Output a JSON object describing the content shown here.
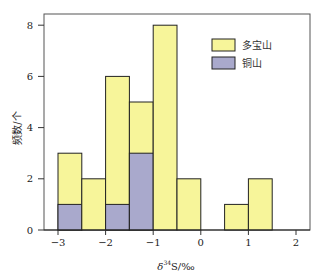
{
  "chart_data": {
    "type": "bar",
    "stacked": true,
    "title": "",
    "xlabel": "δ34S/‰",
    "ylabel": "频数/个",
    "xlim": [
      -3.3,
      2.3
    ],
    "ylim": [
      0,
      8.5
    ],
    "xticks": [
      -3,
      -2,
      -1,
      0,
      1,
      2
    ],
    "xtick_labels": [
      "−3",
      "−2",
      "−1",
      "0",
      "1",
      "2"
    ],
    "yticks": [
      0,
      2,
      4,
      6,
      8
    ],
    "ytick_labels": [
      "0",
      "2",
      "4",
      "6",
      "8"
    ],
    "bin_width": 0.5,
    "bins": [
      {
        "x0": -3.0,
        "x1": -2.5,
        "total": 3,
        "tongshan": 1
      },
      {
        "x0": -2.5,
        "x1": -2.0,
        "total": 2,
        "tongshan": 0
      },
      {
        "x0": -2.0,
        "x1": -1.5,
        "total": 6,
        "tongshan": 1
      },
      {
        "x0": -1.5,
        "x1": -1.0,
        "total": 5,
        "tongshan": 3
      },
      {
        "x0": -1.0,
        "x1": -0.5,
        "total": 8,
        "tongshan": 0
      },
      {
        "x0": -0.5,
        "x1": 0.0,
        "total": 2,
        "tongshan": 0
      },
      {
        "x0": 0.5,
        "x1": 1.0,
        "total": 1,
        "tongshan": 0
      },
      {
        "x0": 1.0,
        "x1": 1.5,
        "total": 2,
        "tongshan": 0
      }
    ],
    "categories": [
      "-3~-2.5",
      "-2.5~-2",
      "-2~-1.5",
      "-1.5~-1",
      "-1~-0.5",
      "-0.5~0",
      "0.5~1",
      "1~1.5"
    ],
    "series": [
      {
        "name": "多宝山",
        "color": "#f7f59a",
        "values": [
          2,
          2,
          5,
          2,
          8,
          2,
          1,
          2
        ]
      },
      {
        "name": "铜山",
        "color": "#a9a9cc",
        "values": [
          1,
          0,
          1,
          3,
          0,
          0,
          0,
          0
        ]
      }
    ],
    "legend": {
      "position": "upper right",
      "entries": [
        "多宝山",
        "铜山"
      ]
    },
    "grid": false
  },
  "colors": {
    "duobaoshan": "#f7f59a",
    "tongshan": "#a9a9cc",
    "edge": "#222222",
    "frame": "#555555"
  },
  "labels": {
    "xlabel_prefix": "δ",
    "xlabel_sup": "34",
    "xlabel_suffix": "S/‰",
    "ylabel": "频数/个",
    "legend_duobaoshan": "多宝山",
    "legend_tongshan": "铜山"
  }
}
